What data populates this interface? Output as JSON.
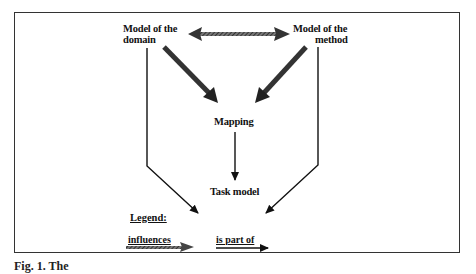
{
  "diagram": {
    "nodes": [
      {
        "id": "domain",
        "line1": "Model of the",
        "line2": "domain"
      },
      {
        "id": "method",
        "line1": "Model of the",
        "line2": "method"
      },
      {
        "id": "mapping",
        "label": "Mapping"
      },
      {
        "id": "task",
        "label": "Task model"
      }
    ],
    "edges": [
      {
        "from": "domain",
        "to": "method",
        "type": "influences",
        "bidirectional": true
      },
      {
        "from": "domain",
        "to": "mapping",
        "type": "influences"
      },
      {
        "from": "method",
        "to": "mapping",
        "type": "influences"
      },
      {
        "from": "domain",
        "to": "task",
        "type": "is part of"
      },
      {
        "from": "method",
        "to": "task",
        "type": "is part of"
      },
      {
        "from": "mapping",
        "to": "task",
        "type": "is part of"
      }
    ],
    "legend": {
      "title": "Legend:",
      "items": [
        {
          "label": "influences",
          "style": "thick hatched arrow"
        },
        {
          "label": "is part of",
          "style": "thin solid arrow"
        }
      ]
    },
    "caption": "Fig. 1. The"
  }
}
